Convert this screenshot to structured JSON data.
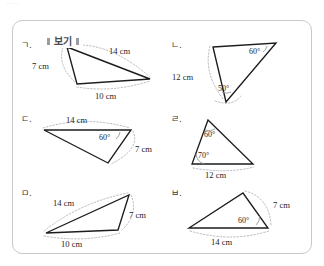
{
  "page_scrap_text": "·····",
  "box": {
    "title": "보기"
  },
  "figures": [
    {
      "label": "ㄱ.",
      "name": "triangle-g",
      "annotations": [
        {
          "text": "14 cm",
          "kind": "length"
        },
        {
          "text": "7 cm",
          "kind": "length"
        },
        {
          "text": "10 cm",
          "kind": "length"
        }
      ]
    },
    {
      "label": "ㄴ.",
      "name": "triangle-n",
      "annotations": [
        {
          "text": "60°",
          "kind": "angle"
        },
        {
          "text": "12 cm",
          "kind": "length"
        },
        {
          "text": "50°",
          "kind": "angle"
        }
      ]
    },
    {
      "label": "ㄷ.",
      "name": "triangle-d",
      "annotations": [
        {
          "text": "14 cm",
          "kind": "length"
        },
        {
          "text": "60°",
          "kind": "angle"
        },
        {
          "text": "7 cm",
          "kind": "length"
        }
      ]
    },
    {
      "label": "ㄹ.",
      "name": "triangle-r",
      "annotations": [
        {
          "text": "60°",
          "kind": "angle"
        },
        {
          "text": "70°",
          "kind": "angle"
        },
        {
          "text": "12 cm",
          "kind": "length"
        }
      ]
    },
    {
      "label": "ㅁ.",
      "name": "triangle-m",
      "annotations": [
        {
          "text": "14 cm",
          "kind": "length"
        },
        {
          "text": "7 cm",
          "kind": "length"
        },
        {
          "text": "10 cm",
          "kind": "length"
        }
      ]
    },
    {
      "label": "ㅂ.",
      "name": "triangle-b",
      "annotations": [
        {
          "text": "7 cm",
          "kind": "length"
        },
        {
          "text": "60°",
          "kind": "angle"
        },
        {
          "text": "14 cm",
          "kind": "length"
        }
      ]
    }
  ]
}
